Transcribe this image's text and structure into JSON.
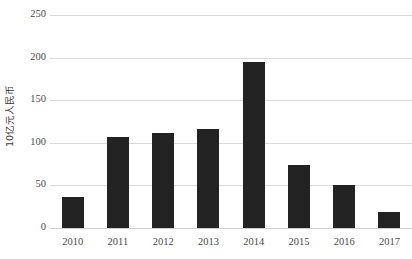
{
  "chart_data": {
    "type": "bar",
    "title": "",
    "xlabel": "",
    "ylabel": "10亿元人民币",
    "categories": [
      "2010",
      "2011",
      "2012",
      "2013",
      "2014",
      "2015",
      "2016",
      "2017"
    ],
    "values": [
      36,
      107,
      111,
      116,
      195,
      74,
      51,
      19
    ],
    "series": [
      {
        "name": "",
        "values": [
          36,
          107,
          111,
          116,
          195,
          74,
          51,
          19
        ]
      }
    ],
    "ylim": [
      0,
      250
    ],
    "yticks": [
      "0",
      "50",
      "100",
      "150",
      "200",
      "250"
    ],
    "ytick_values": [
      0,
      50,
      100,
      150,
      200,
      250
    ],
    "grid": "horizontal",
    "legend": "none",
    "bar_color": "#232323",
    "gridline_color": "#d9d9d9",
    "background_color": "#ffffff",
    "axis_text_color": "#4a4a4a"
  }
}
